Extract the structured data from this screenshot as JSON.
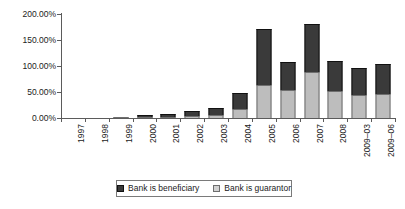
{
  "chart_data": {
    "type": "bar",
    "subtype": "stacked-column",
    "title": "",
    "xlabel": "",
    "ylabel": "",
    "ylim": [
      0,
      200
    ],
    "ytick_labels": [
      "0.00%",
      "50.00%",
      "100.00%",
      "150.00%",
      "200.00%"
    ],
    "ytick_values": [
      0,
      50,
      100,
      150,
      200
    ],
    "grid": false,
    "legend_position": "bottom",
    "categories": [
      "1997",
      "1998",
      "1999",
      "2000",
      "2001",
      "2002",
      "2003",
      "2004",
      "2005",
      "2006",
      "2007",
      "2008",
      "2009–03",
      "2009–06"
    ],
    "series": [
      {
        "name": "Bank is guarantor",
        "color": "#bdbdbd",
        "values": [
          0,
          0,
          2,
          2,
          1,
          3,
          6,
          18,
          63,
          53,
          89,
          52,
          45,
          47
        ]
      },
      {
        "name": "Bank is beneficiary",
        "color": "#3a3a3a",
        "values": [
          0,
          0,
          0,
          4,
          5,
          10,
          13,
          30,
          109,
          54,
          92,
          58,
          52,
          57
        ]
      }
    ],
    "totals": [
      0,
      0,
      2,
      6,
      6,
      13,
      19,
      48,
      172,
      107,
      181,
      110,
      97,
      104
    ],
    "stack_order": [
      "Bank is guarantor",
      "Bank is beneficiary"
    ]
  },
  "legend": {
    "items": [
      {
        "label": "Bank is beneficiary",
        "swatch": "dark-square-icon"
      },
      {
        "label": "Bank is guarantor",
        "swatch": "light-square-icon"
      }
    ]
  }
}
